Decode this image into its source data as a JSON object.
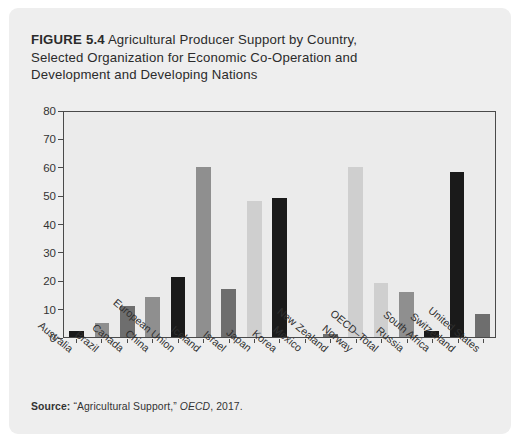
{
  "figure": {
    "number_label": "FIGURE 5.4",
    "title": "Agricultural Producer Support by Country, Selected Organization for Economic Co-Operation and Development and Developing Nations",
    "title_line1": "Agricultural Producer Support by Country,",
    "title_line2": "Selected Organization for Economic Co-Operation and",
    "title_line3": "Development and Developing Nations"
  },
  "source": {
    "label": "Source:",
    "citation": "“Agricultural Support,”",
    "publisher": "OECD",
    "year": ", 2017."
  },
  "colors": {
    "card_background": "#eeeeee",
    "plot_background": "#ebebeb",
    "plot_border": "#4a4a4a",
    "bar_black": "#1a1a1a",
    "bar_light_gray": "#b9b9b9",
    "bar_dark_gray": "#6e6e6e",
    "bar_medium_gray": "#8f8f8f",
    "bar_pale_gray": "#cfcfcf",
    "text": "#2b2b2b"
  },
  "chart_data": {
    "type": "bar",
    "title": "FIGURE 5.4 Agricultural Producer Support by Country, Selected Organization for Economic Co-Operation and Development and Developing Nations",
    "xlabel": "",
    "ylabel": "",
    "ylim": [
      0,
      80
    ],
    "yticks": [
      0,
      10,
      20,
      30,
      40,
      50,
      60,
      70,
      80
    ],
    "ytick_labels": [
      "0",
      "10",
      "20",
      "30",
      "40",
      "50",
      "60",
      "70",
      "80"
    ],
    "grid": false,
    "legend": "none",
    "categories": [
      "Australia",
      "Brazil",
      "Canada",
      "China",
      "European Union",
      "Iceland",
      "Israel",
      "Japan",
      "Korea",
      "Mexico",
      "New Zealand",
      "Norway",
      "OECD–Total",
      "Russia",
      "South Africa",
      "Switzerland",
      "United States"
    ],
    "values": [
      2,
      5,
      11,
      14,
      21,
      60,
      17,
      48,
      49,
      0,
      1,
      60,
      19,
      16,
      2,
      58,
      8
    ],
    "bar_colors": [
      "#1a1a1a",
      "#8f8f8f",
      "#6e6e6e",
      "#8f8f8f",
      "#1a1a1a",
      "#8f8f8f",
      "#6e6e6e",
      "#cfcfcf",
      "#1a1a1a",
      "#8f8f8f",
      "#6e6e6e",
      "#cfcfcf",
      "#cfcfcf",
      "#8f8f8f",
      "#1a1a1a",
      "#1a1a1a",
      "#6e6e6e"
    ]
  }
}
